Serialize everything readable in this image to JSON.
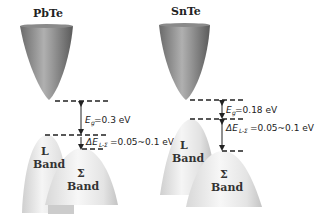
{
  "panels": [
    {
      "title": "PbTe",
      "conduction_band": "conduction-band",
      "valence_bands": [
        {
          "name": "L",
          "label": "Band"
        },
        {
          "name": "Σ",
          "label": "Band"
        }
      ],
      "annotations": {
        "gap": {
          "symbol": "E",
          "subscript": "g",
          "value": "=0.3 eV"
        },
        "offset": {
          "symbol": "ΔE",
          "subscript": "L-Σ",
          "value": "=0.05~0.1 eV"
        }
      }
    },
    {
      "title": "SnTe",
      "conduction_band": "conduction-band",
      "valence_bands": [
        {
          "name": "L",
          "label": "Band"
        },
        {
          "name": "Σ",
          "label": "Band"
        }
      ],
      "annotations": {
        "gap": {
          "symbol": "E",
          "subscript": "g",
          "value": "=0.18 eV"
        },
        "offset": {
          "symbol": "ΔE",
          "subscript": "L-Σ",
          "value": "=0.05~0.1 eV"
        }
      }
    }
  ],
  "colors": {
    "conduction_dark": "#5a5a5a",
    "conduction_light": "#b5b5b5",
    "valence_light": "#f2f2f2",
    "valence_mid": "#c8c8c8",
    "line": "#222222"
  }
}
